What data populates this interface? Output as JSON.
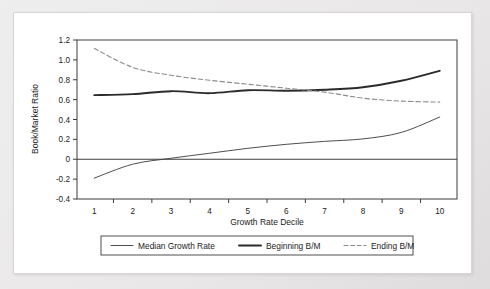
{
  "chart_data": {
    "type": "line",
    "title": "",
    "xlabel": "Growth Rate Decile",
    "ylabel": "Book/Market Ratio",
    "categories": [
      "1",
      "2",
      "3",
      "4",
      "5",
      "6",
      "7",
      "8",
      "9",
      "10"
    ],
    "x": [
      1,
      2,
      3,
      4,
      5,
      6,
      7,
      8,
      9,
      10
    ],
    "xlim": [
      0.55,
      10.45
    ],
    "ylim": [
      -0.4,
      1.2
    ],
    "yticks": [
      "1.2",
      "1.0",
      "0.8",
      "0.6",
      "0.4",
      "0.2",
      "0",
      "-0.2",
      "-0.4"
    ],
    "ytick_values": [
      1.2,
      1.0,
      0.8,
      0.6,
      0.4,
      0.2,
      0,
      -0.2,
      -0.4
    ],
    "xticks": [
      "1",
      "2",
      "3",
      "4",
      "5",
      "6",
      "7",
      "8",
      "9",
      "10"
    ],
    "grid": false,
    "zero_line": true,
    "legend_position": "bottom",
    "series": [
      {
        "name": "Median Growth Rate",
        "style": "solid-thin",
        "color": "#444444",
        "values": [
          -0.19,
          -0.05,
          0.01,
          0.06,
          0.11,
          0.15,
          0.18,
          0.205,
          0.27,
          0.425
        ]
      },
      {
        "name": "Beginning B/M",
        "style": "solid-thick",
        "color": "#2b2b2b",
        "values": [
          0.645,
          0.655,
          0.685,
          0.665,
          0.695,
          0.69,
          0.7,
          0.725,
          0.79,
          0.89
        ]
      },
      {
        "name": "Ending B/M",
        "style": "dashed",
        "color": "#8c8c8c",
        "values": [
          1.115,
          0.925,
          0.845,
          0.795,
          0.755,
          0.715,
          0.675,
          0.615,
          0.585,
          0.575
        ]
      }
    ]
  },
  "legend": {
    "items": [
      {
        "label": "Median Growth Rate"
      },
      {
        "label": "Beginning B/M"
      },
      {
        "label": "Ending B/M"
      }
    ]
  }
}
